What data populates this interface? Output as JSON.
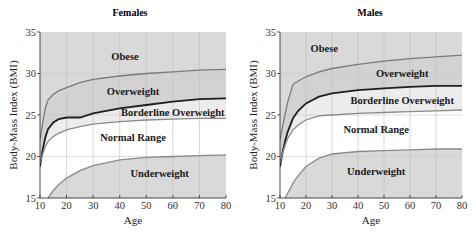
{
  "chart_data": [
    {
      "type": "area",
      "title": "Females",
      "xlabel": "Age",
      "ylabel": "Body-Mass Index (BMI)",
      "xlim": [
        10,
        80
      ],
      "ylim": [
        15,
        35
      ],
      "xticks": [
        10,
        20,
        30,
        40,
        50,
        60,
        70,
        80
      ],
      "yticks": [
        15,
        20,
        25,
        30,
        35
      ],
      "grid": true,
      "regions": [
        {
          "label": "Obese",
          "fill": "#d9d9d9",
          "label_at": [
            42,
            32
          ]
        },
        {
          "label": "Overweight",
          "fill": "#d9d9d9",
          "label_at": [
            45,
            27.8
          ]
        },
        {
          "label": "Borderline Overweight",
          "fill": "#ececec",
          "label_at": [
            60,
            25.3
          ]
        },
        {
          "label": "Normal Range",
          "fill": "#ffffff",
          "label_at": [
            45,
            22.3
          ]
        },
        {
          "label": "Underweight",
          "fill": "#d9d9d9",
          "label_at": [
            55,
            17.9
          ]
        }
      ],
      "x": [
        10,
        11,
        12,
        13,
        15,
        17,
        20,
        25,
        30,
        40,
        50,
        60,
        70,
        80
      ],
      "series": [
        {
          "name": "Obese threshold",
          "color": "#7a7a7a",
          "values": [
            22.0,
            24.0,
            25.8,
            26.8,
            27.5,
            27.9,
            28.3,
            28.9,
            29.3,
            29.7,
            30.0,
            30.2,
            30.4,
            30.5
          ]
        },
        {
          "name": "Overweight threshold",
          "color": "#1e1e1e",
          "values": [
            18.8,
            20.8,
            22.3,
            23.3,
            24.1,
            24.5,
            24.7,
            24.7,
            25.2,
            25.8,
            26.2,
            26.6,
            26.9,
            27.0
          ]
        },
        {
          "name": "Borderline threshold",
          "color": "#8a8a8a",
          "values": [
            19.2,
            20.3,
            21.2,
            21.8,
            22.4,
            22.8,
            23.2,
            23.6,
            23.9,
            24.2,
            24.4,
            24.5,
            24.6,
            24.6
          ]
        },
        {
          "name": "Underweight threshold",
          "color": "#8a8a8a",
          "values": [
            null,
            null,
            null,
            15.0,
            15.9,
            16.6,
            17.4,
            18.3,
            18.9,
            19.6,
            19.9,
            20.0,
            20.1,
            20.2
          ]
        }
      ]
    },
    {
      "type": "area",
      "title": "Males",
      "xlabel": "Age",
      "ylabel": "Body-Mass Index (BMI)",
      "xlim": [
        10,
        80
      ],
      "ylim": [
        15,
        35
      ],
      "xticks": [
        10,
        20,
        30,
        40,
        50,
        60,
        70,
        80
      ],
      "yticks": [
        15,
        20,
        25,
        30,
        35
      ],
      "grid": true,
      "regions": [
        {
          "label": "Obese",
          "fill": "#d9d9d9",
          "label_at": [
            27,
            33
          ]
        },
        {
          "label": "Overweight",
          "fill": "#d9d9d9",
          "label_at": [
            57,
            30
          ]
        },
        {
          "label": "Borderline Overweight",
          "fill": "#ececec",
          "label_at": [
            57,
            26.8
          ]
        },
        {
          "label": "Normal Range",
          "fill": "#ffffff",
          "label_at": [
            47,
            23.2
          ]
        },
        {
          "label": "Underweight",
          "fill": "#d9d9d9",
          "label_at": [
            47,
            18.2
          ]
        }
      ],
      "x": [
        10,
        11,
        12,
        13,
        15,
        17,
        20,
        25,
        30,
        40,
        50,
        60,
        70,
        80
      ],
      "series": [
        {
          "name": "Obese threshold",
          "color": "#7a7a7a",
          "values": [
            22.0,
            23.6,
            25.2,
            26.6,
            28.7,
            29.1,
            29.6,
            30.2,
            30.6,
            31.1,
            31.5,
            31.8,
            32.0,
            32.2
          ]
        },
        {
          "name": "Overweight threshold",
          "color": "#1e1e1e",
          "values": [
            18.8,
            20.5,
            21.9,
            23.0,
            24.6,
            25.5,
            26.4,
            27.2,
            27.6,
            28.0,
            28.2,
            28.4,
            28.5,
            28.5
          ]
        },
        {
          "name": "Borderline threshold",
          "color": "#8a8a8a",
          "values": [
            19.2,
            20.4,
            21.4,
            22.2,
            23.2,
            23.8,
            24.4,
            24.9,
            25.0,
            25.2,
            25.3,
            25.4,
            25.5,
            25.6
          ]
        },
        {
          "name": "Underweight threshold",
          "color": "#8a8a8a",
          "values": [
            null,
            null,
            15.0,
            15.6,
            16.8,
            17.7,
            18.8,
            19.8,
            20.3,
            20.6,
            20.7,
            20.8,
            20.9,
            20.9
          ]
        }
      ]
    }
  ]
}
